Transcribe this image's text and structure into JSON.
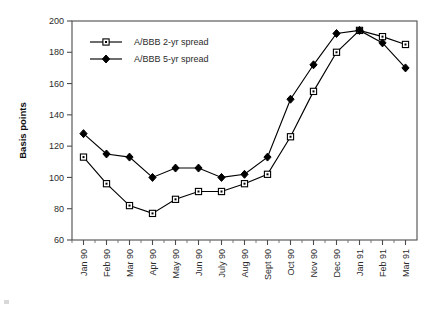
{
  "chart_data": {
    "type": "line",
    "title": "",
    "xlabel": "",
    "ylabel": "Basis points",
    "ylim": [
      60,
      200
    ],
    "ytick_step": 20,
    "yticks": [
      60,
      80,
      100,
      120,
      140,
      160,
      180,
      200
    ],
    "grid": false,
    "legend_position": "top-left inside",
    "categories": [
      "Jan 90",
      "Feb 90",
      "Mar 90",
      "Apr 90",
      "May 90",
      "Jun 90",
      "July 90",
      "Aug 90",
      "Sept 90",
      "Oct 90",
      "Nov 90",
      "Dec 90",
      "Jan 91",
      "Feb 91",
      "Mar 91"
    ],
    "series": [
      {
        "name": "A/BBB 2-yr spread",
        "marker": "open-square",
        "values": [
          113,
          96,
          82,
          77,
          86,
          91,
          91,
          96,
          102,
          126,
          155,
          180,
          194,
          190,
          185
        ]
      },
      {
        "name": "A/BBB 5-yr spread",
        "marker": "filled-diamond",
        "values": [
          128,
          115,
          113,
          100,
          106,
          106,
          100,
          102,
          113,
          150,
          172,
          192,
          194,
          186,
          170
        ]
      }
    ]
  },
  "legend": {
    "entries": [
      {
        "label": "A/BBB 2-yr spread"
      },
      {
        "label": "A/BBB 5-yr spread"
      }
    ]
  },
  "axes": {
    "y_title": "Basis points"
  },
  "colors": {
    "line": "#000000",
    "axis": "#4d4d4d",
    "text": "#2b2b2b",
    "background": "#ffffff"
  }
}
